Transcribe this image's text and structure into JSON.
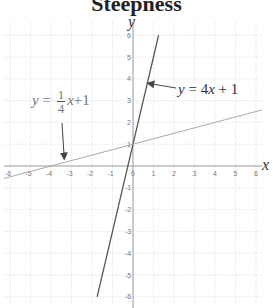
{
  "chart_data": {
    "type": "line",
    "title": "Steepness",
    "xlabel": "x",
    "ylabel": "y",
    "xlim": [
      -6,
      6
    ],
    "ylim": [
      -6,
      6
    ],
    "grid": true,
    "x_ticks": [
      -6,
      -5,
      -4,
      -3,
      -2,
      -1,
      0,
      1,
      2,
      3,
      4,
      5,
      6
    ],
    "y_ticks": [
      -6,
      -5,
      -4,
      -3,
      -2,
      -1,
      1,
      2,
      3,
      4,
      5,
      6
    ],
    "series": [
      {
        "name": "y = 4x + 1",
        "slope": 4,
        "intercept": 1,
        "color": "#555555",
        "x": [
          -1.75,
          1.25
        ],
        "y": [
          -6,
          6
        ]
      },
      {
        "name": "y = 1/4 x + 1",
        "slope": 0.25,
        "intercept": 1,
        "color": "#aaaaaa",
        "x": [
          -6.3,
          6.3
        ],
        "y": [
          -0.575,
          2.575
        ]
      }
    ],
    "annotations": [
      {
        "text": "y = 4x + 1",
        "arrow_to": [
          0.7,
          3.8
        ]
      },
      {
        "text": "y = 1/4 x + 1",
        "arrow_to": [
          -3.3,
          0.2
        ]
      }
    ]
  },
  "title": "Steepness",
  "labels": {
    "x_axis": "x",
    "y_axis": "y",
    "steep_eq": {
      "y": "y",
      "eq": " = 4",
      "x": "x",
      "rest": " + 1"
    },
    "shallow_eq": {
      "y": "y",
      "eq": " = ",
      "num": "1",
      "den": "4",
      "x": "x",
      "rest": "+1"
    }
  }
}
